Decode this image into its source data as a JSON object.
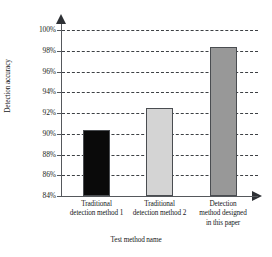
{
  "chart_data": {
    "type": "bar",
    "title": "",
    "xlabel": "Test method name",
    "ylabel": "Detection accuracy",
    "categories": [
      "Traditional detection method 1",
      "Traditional detection method 2",
      "Detection method designed in this paper"
    ],
    "category_lines": [
      [
        "Traditional",
        "detection method 1"
      ],
      [
        "Traditional",
        "detection method 2"
      ],
      [
        "Detection",
        "method designed",
        "in this paper"
      ]
    ],
    "values": [
      90.4,
      92.5,
      98.4
    ],
    "ylim": [
      84,
      100
    ],
    "ytick_labels": [
      "84%",
      "86%",
      "88%",
      "90%",
      "92%",
      "94%",
      "96%",
      "98%",
      "100%"
    ],
    "ytick_values": [
      84,
      86,
      88,
      90,
      92,
      94,
      96,
      98,
      100
    ],
    "grid": true,
    "grid_style": "dashed",
    "legend": "none",
    "bar_colors": [
      "#0a0a0a",
      "#d4d4d4",
      "#989898"
    ],
    "bar_edge_color": "#4a4d51",
    "axis_color": "#55585c",
    "y_axis_arrow": true,
    "x_axis_arrow": true
  }
}
